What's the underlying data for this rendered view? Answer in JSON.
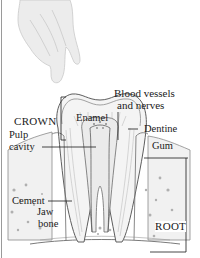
{
  "diagram": {
    "illustration": [
      "hand-icon",
      "tooth-cross-section",
      "jaw-bone-texture"
    ],
    "labels": {
      "blood_vessels_line1": "Blood vessels",
      "blood_vessels_line2": "and nerves",
      "enamel": "Enamel",
      "crown": "CROWN",
      "dentine": "Dentine",
      "pulp_line1": "Pulp",
      "pulp_line2": "cavity",
      "gum": "Gum",
      "cement": "Cement",
      "jaw_line1": "Jaw",
      "jaw_line2": "bone",
      "root": "ROOT"
    },
    "colors": {
      "text": "#1a1a1a",
      "line_art": "#6b6b6b",
      "shading": "#c8c8c8",
      "hand": "#e6e6e6",
      "border": "#9a9a9a"
    }
  }
}
